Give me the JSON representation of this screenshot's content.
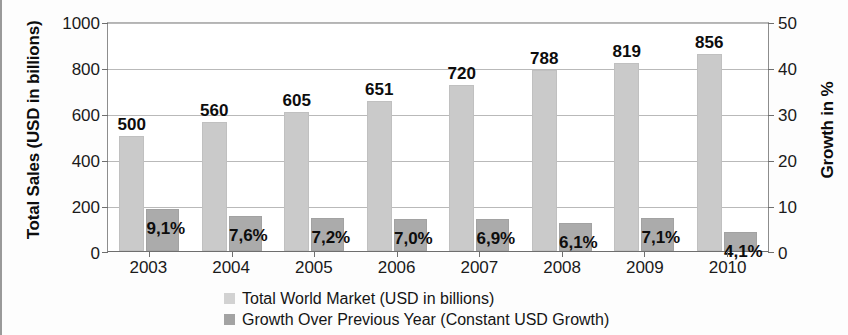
{
  "chart_data": {
    "type": "bar",
    "title": "",
    "subtitle": "",
    "xlabel": "",
    "ylabel": "Total Sales (USD in billions)",
    "y2label": "Growth in %",
    "categories": [
      "2003",
      "2004",
      "2005",
      "2006",
      "2007",
      "2008",
      "2009",
      "2010"
    ],
    "series": [
      {
        "name": "Total World Market (USD in billions)",
        "axis": "left",
        "color": "#cacaca",
        "values": [
          500,
          560,
          605,
          651,
          720,
          788,
          819,
          856
        ],
        "labels": [
          "500",
          "560",
          "605",
          "651",
          "720",
          "788",
          "819",
          "856"
        ]
      },
      {
        "name": "Growth Over Previous Year (Constant USD Growth)",
        "axis": "right",
        "color": "#ababab",
        "values": [
          9.1,
          7.6,
          7.2,
          7.0,
          6.9,
          6.1,
          7.1,
          4.1
        ],
        "labels": [
          "9,1%",
          "7,6%",
          "7,2%",
          "7,0%",
          "6,9%",
          "6,1%",
          "7,1%",
          "4,1%"
        ]
      }
    ],
    "ylim": [
      0,
      1000
    ],
    "y2lim": [
      0,
      50
    ],
    "yticks": [
      "0",
      "200",
      "400",
      "600",
      "800",
      "1000"
    ],
    "y2ticks": [
      "0",
      "10",
      "20",
      "30",
      "40",
      "50"
    ],
    "grid": true,
    "legend_position": "bottom"
  }
}
